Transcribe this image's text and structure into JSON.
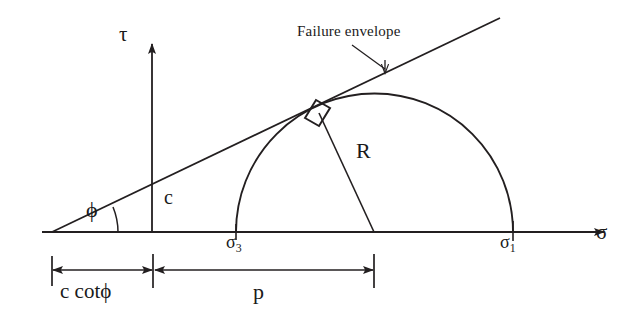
{
  "figure": {
    "type": "diagram",
    "stroke_color": "#231f20",
    "background": "#ffffff"
  },
  "axes": {
    "vertical_label": "τ",
    "horizontal_label": "σ",
    "vertical_axis_name": "shear-stress-axis",
    "horizontal_axis_name": "normal-stress-axis"
  },
  "annotations": {
    "failure_envelope": "Failure envelope",
    "cohesion_intercept": "c",
    "friction_angle": "ϕ",
    "radius": "R",
    "sigma_minor_base": "σ",
    "sigma_minor_sub": "3",
    "sigma_major_base": "σ",
    "sigma_major_sub": "1"
  },
  "dimensions": {
    "c_cot_phi": "c cotϕ",
    "p": "p"
  },
  "geometry": {
    "axis_y": 232,
    "tau_axis_x": 152,
    "envelope_origin_x": 52,
    "circle_left_x": 236,
    "circle_right_x": 513,
    "circle_center_x": 374,
    "circle_radius": 138,
    "tangent_point": {
      "x": 318,
      "y": 112
    },
    "envelope_end": {
      "x": 500,
      "y": 18
    },
    "phi_degrees": 21
  }
}
